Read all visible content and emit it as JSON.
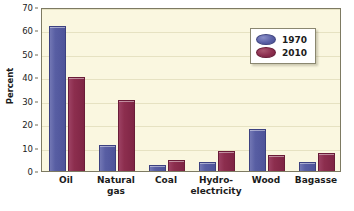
{
  "chart_data": {
    "type": "bar",
    "title": "",
    "xlabel": "",
    "ylabel": "Percent",
    "ylim": [
      0,
      70
    ],
    "yticks": [
      0,
      10,
      20,
      30,
      40,
      50,
      60,
      70
    ],
    "grid": true,
    "legend_position": "top-right",
    "categories": [
      "Oil",
      "Natural\ngas",
      "Coal",
      "Hydro-\nelectricity",
      "Wood",
      "Bagasse"
    ],
    "series": [
      {
        "name": "1970",
        "color": "#585ea3",
        "values": [
          62,
          11,
          2.5,
          4,
          18,
          4
        ]
      },
      {
        "name": "2010",
        "color": "#8c2e4e",
        "values": [
          40,
          30.5,
          4.5,
          8.5,
          7,
          7.5
        ]
      }
    ]
  },
  "axes": {
    "y_title": "Percent",
    "y_tick_labels": [
      "70",
      "60",
      "50",
      "40",
      "30",
      "20",
      "10",
      "0"
    ],
    "x_tick_labels": [
      "Oil",
      "Natural\ngas",
      "Coal",
      "Hydro-\nelectricity",
      "Wood",
      "Bagasse"
    ]
  },
  "legend": {
    "entries": [
      {
        "label": "1970",
        "swatch": "ellipse-blue"
      },
      {
        "label": "2010",
        "swatch": "ellipse-darkred"
      }
    ]
  },
  "colors": {
    "series_1970": "#585ea3",
    "series_2010": "#8c2e4e",
    "plot_background": "#faf7e0",
    "figure_background": "#ffffff",
    "axis": "#7d7a62",
    "gridline": "#e6e2c2"
  }
}
